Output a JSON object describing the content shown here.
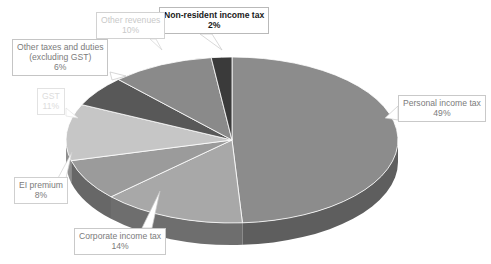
{
  "chart_data": {
    "type": "pie",
    "title": "",
    "three_d": true,
    "start_angle_deg": 0,
    "direction": "clockwise",
    "legend": "none",
    "labels_position": "outside-callout",
    "categories": [
      "Personal income tax",
      "Corporate income tax",
      "EI premium",
      "GST",
      "Other taxes and duties (excluding GST)",
      "Other revenues",
      "Non-resident income tax"
    ],
    "values": [
      49,
      14,
      8,
      11,
      6,
      10,
      2
    ],
    "value_suffix": "%",
    "colors": [
      "#8c8c8c",
      "#a8a8a8",
      "#9b9b9b",
      "#c6c6c6",
      "#585858",
      "#8a8a8a",
      "#3a3a3a"
    ],
    "side_colors": [
      "#5e5e5e",
      "#6e6e6e",
      "#676767",
      "#8e8e8e",
      "#3c3c3c",
      "#5c5c5c",
      "#282828"
    ]
  },
  "callouts": {
    "personal": {
      "name": "Personal income tax",
      "value": "49%"
    },
    "corporate": {
      "name": "Corporate income tax",
      "value": "14%"
    },
    "ei": {
      "name": "EI premium",
      "value": "8%"
    },
    "gst": {
      "name": "GST",
      "value": "11%"
    },
    "other_taxes": {
      "name_line1": "Other taxes and duties",
      "name_line2": "(excluding GST)",
      "value": "6%"
    },
    "other_revenues": {
      "name": "Other revenues",
      "value": "10%"
    },
    "non_resident": {
      "name": "Non-resident income tax",
      "value": "2%"
    }
  },
  "theme": {
    "background": "#ffffff",
    "callout_border": "#b9b9b9",
    "text_dark": "#1a1a1a",
    "text_mid": "#7b7b7b",
    "text_light": "#c9c9c9"
  }
}
